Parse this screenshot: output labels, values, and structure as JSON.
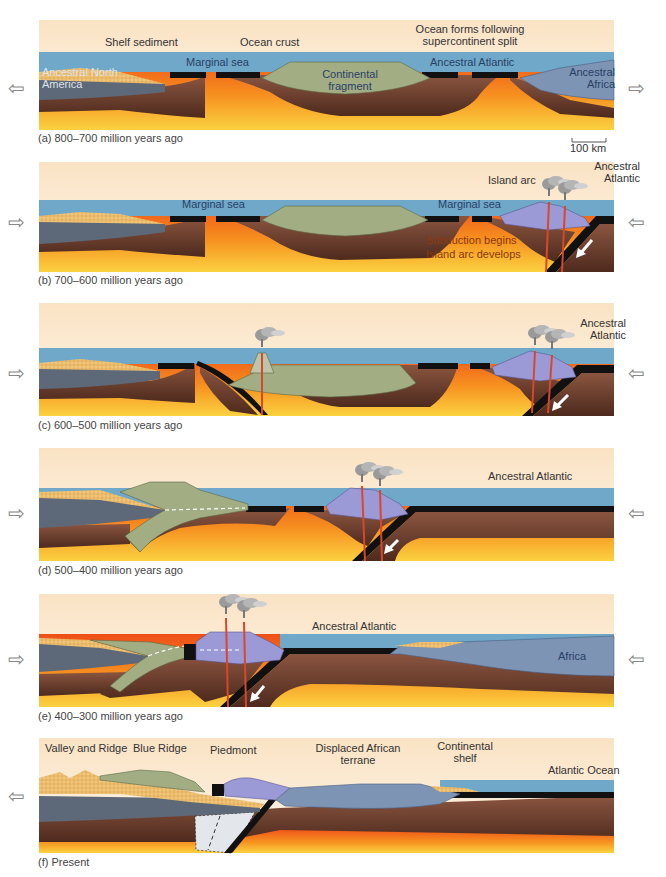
{
  "figure": {
    "colors": {
      "sky": "#fbeedc",
      "sea": "#6fa8c8",
      "ocean_crust": "#111111",
      "continental_crust_north_america": "#5d6878",
      "continental_fragment": "#a3ad83",
      "africa_crust": "#7d94b4",
      "island_arc": "#9c9ad6",
      "shelf_sediment": "#eab86a",
      "lithosphere": "#6b3f2c",
      "asthenosphere_hot": "#f05a1a",
      "asthenosphere_warm": "#f8c23a",
      "magma": "#d9472a",
      "relic": "#e3e6ea"
    },
    "scale_bar": {
      "label": "100 km"
    }
  },
  "panels": [
    {
      "id": "a",
      "caption": "(a) 800–700 million years ago",
      "labels": {
        "shelf_sediment": "Shelf sediment",
        "ocean_crust": "Ocean crust",
        "ocean_forms": "Ocean forms following supercontinent split",
        "marginal_sea": "Marginal sea",
        "continental_fragment": "Continental fragment",
        "ancestral_atlantic": "Ancestral Atlantic",
        "ancestral_north_america": "Ancestral North America",
        "ancestral_africa": "Ancestral Africa"
      },
      "arrows": {
        "left": "⇦",
        "right": "⇨"
      }
    },
    {
      "id": "b",
      "caption": "(b) 700–600 million years ago",
      "labels": {
        "marginal_sea_left": "Marginal sea",
        "marginal_sea_right": "Marginal sea",
        "island_arc": "Island arc",
        "ancestral_atlantic": "Ancestral Atlantic",
        "subduction_begins": "Subduction begins",
        "island_arc_develops": "Island arc develops"
      },
      "arrows": {
        "left": "⇨",
        "right": "⇦"
      }
    },
    {
      "id": "c",
      "caption": "(c) 600–500 million years ago",
      "labels": {
        "ancestral_atlantic": "Ancestral Atlantic"
      },
      "arrows": {
        "left": "⇨",
        "right": "⇦"
      }
    },
    {
      "id": "d",
      "caption": "(d) 500–400 million years ago",
      "labels": {
        "ancestral_atlantic": "Ancestral Atlantic"
      },
      "arrows": {
        "left": "⇨",
        "right": "⇦"
      }
    },
    {
      "id": "e",
      "caption": "(e) 400–300 million years ago",
      "labels": {
        "ancestral_atlantic": "Ancestral Atlantic",
        "africa": "Africa"
      },
      "arrows": {
        "left": "⇨",
        "right": "⇦"
      }
    },
    {
      "id": "f",
      "caption": "(f) Present",
      "labels": {
        "valley_and_ridge": "Valley and Ridge",
        "blue_ridge": "Blue Ridge",
        "piedmont": "Piedmont",
        "displaced_african_terrane": "Displaced African terrane",
        "continental_shelf": "Continental shelf",
        "atlantic_ocean": "Atlantic Ocean"
      },
      "arrows": {
        "left": "⇦"
      }
    }
  ]
}
